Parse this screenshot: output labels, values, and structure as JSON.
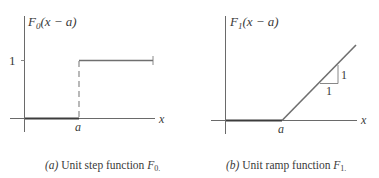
{
  "panels": [
    {
      "id": "a",
      "ylabel_main": "F",
      "ylabel_sub": "0",
      "ylabel_arg": "(x − a)",
      "ytick_label": "1",
      "xtick_label": "a",
      "xaxis_label": "x",
      "caption_tag": "(a)",
      "caption_text": " Unit step function ",
      "caption_sym": "F",
      "caption_sub": "0."
    },
    {
      "id": "b",
      "ylabel_main": "F",
      "ylabel_sub": "1",
      "ylabel_arg": "(x − a)",
      "xtick_label": "a",
      "xaxis_label": "x",
      "slope_run_label": "1",
      "slope_rise_label": "1",
      "caption_tag": "(b)",
      "caption_text": " Unit ramp function ",
      "caption_sym": "F",
      "caption_sub": "1."
    }
  ],
  "colors": {
    "axis": "#6a6a6a",
    "curve": "#6f6f6f",
    "text": "#3a3a3a"
  }
}
